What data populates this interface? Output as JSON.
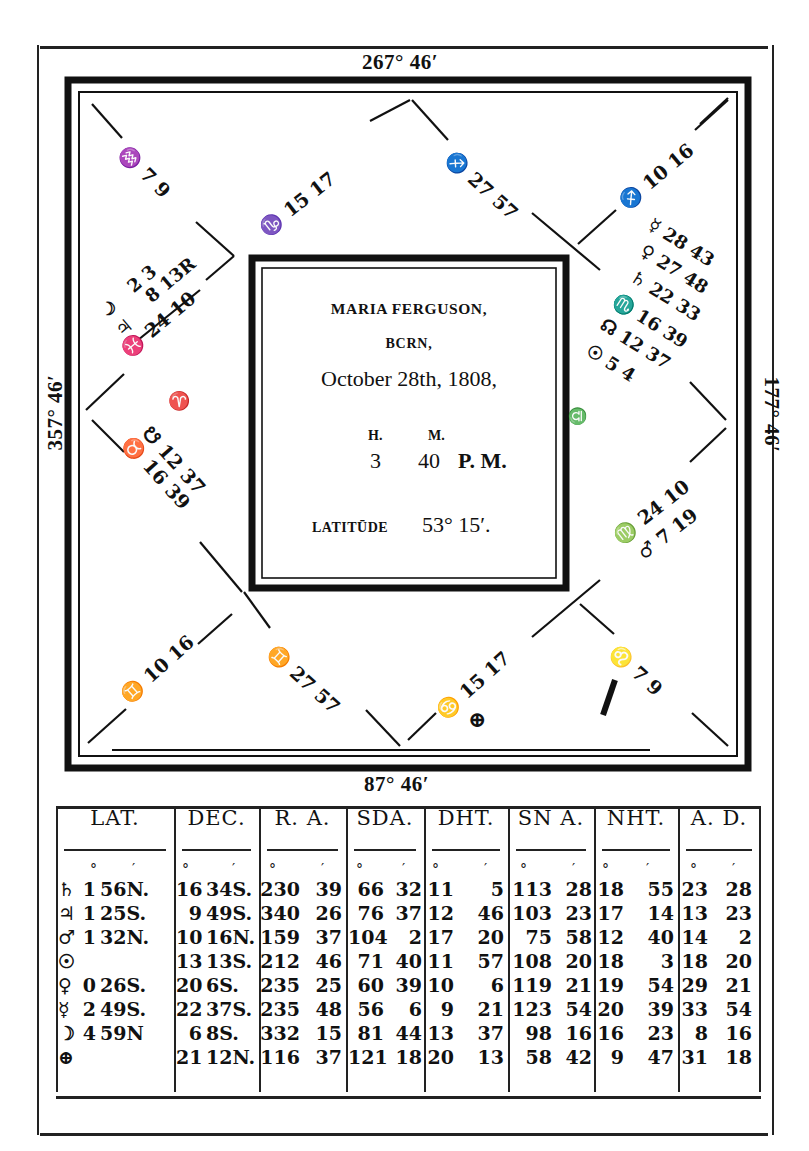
{
  "chart_title": {
    "name": "MARIA FERGUSON,",
    "born": "BCRN,",
    "date": "October 28th, 1808,",
    "time_header_h": "H.",
    "time_header_m": "M.",
    "time_hours": "3",
    "time_minutes": "40",
    "time_suffix": "P. M.",
    "latitude_label": "LATITŪDE",
    "latitude_value": "53° 15′."
  },
  "cusps_outer": {
    "top": "267° 46′",
    "bottom": "87° 46′",
    "left": "357° 46′",
    "right": "177° 46′"
  },
  "houses": {
    "h12_upper_left": {
      "sign": "♒",
      "deg": "7",
      "min": "9"
    },
    "h11_top_left": {
      "sign": "♑",
      "deg": "15",
      "min": "17"
    },
    "h10_top_right": {
      "sign": "♐",
      "deg": "27",
      "min": "57"
    },
    "h9_upper_right": {
      "sign": "♐",
      "deg": "10",
      "min": "16"
    },
    "h1_left_planets": [
      {
        "symbol": "♃",
        "label": "2 3"
      },
      {
        "symbol": "☽",
        "label": "8 13R"
      },
      {
        "symbol": "♃",
        "label": "24 10"
      }
    ],
    "h1_left_cusp": {
      "sign": "♓",
      "deg": "24",
      "min": "10"
    },
    "h1_aries": "♈",
    "h2_left_lower": {
      "sign": "♉",
      "node": "☋",
      "deg1": "12",
      "min1": "37",
      "deg2": "16",
      "min2": "39"
    },
    "h8_right_planets": [
      {
        "symbol": "☿",
        "deg": "28",
        "min": "43"
      },
      {
        "symbol": "♀",
        "deg": "27",
        "min": "48"
      },
      {
        "symbol": "♄",
        "deg": "22",
        "min": "33"
      },
      {
        "symbol": "♏",
        "deg": "16",
        "min": "39"
      },
      {
        "symbol": "☊",
        "deg": "12",
        "min": "37"
      },
      {
        "symbol": "☉",
        "deg": "5",
        "min": "4"
      }
    ],
    "h7_libra": "♎",
    "h6_right_lower": {
      "sign": "♍",
      "deg": "24",
      "min": "10",
      "planet": "♂",
      "pdeg": "7",
      "pmin": "19"
    },
    "h3_lower_left": {
      "sign": "♊",
      "deg": "10",
      "min": "16"
    },
    "h4_bottom_left": {
      "sign": "♊",
      "deg": "27",
      "min": "57"
    },
    "h5_bottom_right": {
      "sign": "♋",
      "deg": "15",
      "min": "17"
    },
    "h6_lower_right": {
      "sign": "♌",
      "deg": "7",
      "min": "9"
    },
    "part_of_fortune": "⊕"
  },
  "table": {
    "columns": [
      {
        "header": "LAT.",
        "units": [
          "°",
          "′"
        ]
      },
      {
        "header": "DEC.",
        "units": [
          "°",
          "′"
        ]
      },
      {
        "header": "R. A.",
        "units": [
          "°",
          "′"
        ]
      },
      {
        "header": "SDA.",
        "units": [
          "°",
          "′"
        ]
      },
      {
        "header": "DHT.",
        "units": [
          "°",
          "′"
        ]
      },
      {
        "header": "SN A.",
        "units": [
          "°",
          "′"
        ]
      },
      {
        "header": "NHT.",
        "units": [
          "°",
          "′"
        ]
      },
      {
        "header": "A. D.",
        "units": [
          "°",
          "′"
        ]
      }
    ],
    "rows": [
      {
        "planet": "♄",
        "lat": [
          "1",
          "56N."
        ],
        "dec": [
          "16",
          "34S."
        ],
        "ra": [
          "230",
          "39"
        ],
        "sda": [
          "66",
          "32"
        ],
        "dht": [
          "11",
          "5"
        ],
        "sna": [
          "113",
          "28"
        ],
        "nht": [
          "18",
          "55"
        ],
        "ad": [
          "23",
          "28"
        ]
      },
      {
        "planet": "♃",
        "lat": [
          "1",
          "25S."
        ],
        "dec": [
          "9",
          "49S."
        ],
        "ra": [
          "340",
          "26"
        ],
        "sda": [
          "76",
          "37"
        ],
        "dht": [
          "12",
          "46"
        ],
        "sna": [
          "103",
          "23"
        ],
        "nht": [
          "17",
          "14"
        ],
        "ad": [
          "13",
          "23"
        ]
      },
      {
        "planet": "♂",
        "lat": [
          "1",
          "32N."
        ],
        "dec": [
          "10",
          "16N."
        ],
        "ra": [
          "159",
          "37"
        ],
        "sda": [
          "104",
          "2"
        ],
        "dht": [
          "17",
          "20"
        ],
        "sna": [
          "75",
          "58"
        ],
        "nht": [
          "12",
          "40"
        ],
        "ad": [
          "14",
          "2"
        ]
      },
      {
        "planet": "☉",
        "lat": [
          "",
          ""
        ],
        "dec": [
          "13",
          "13S."
        ],
        "ra": [
          "212",
          "46"
        ],
        "sda": [
          "71",
          "40"
        ],
        "dht": [
          "11",
          "57"
        ],
        "sna": [
          "108",
          "20"
        ],
        "nht": [
          "18",
          "3"
        ],
        "ad": [
          "18",
          "20"
        ]
      },
      {
        "planet": "♀",
        "lat": [
          "0",
          "26S."
        ],
        "dec": [
          "20",
          "6S."
        ],
        "ra": [
          "235",
          "25"
        ],
        "sda": [
          "60",
          "39"
        ],
        "dht": [
          "10",
          "6"
        ],
        "sna": [
          "119",
          "21"
        ],
        "nht": [
          "19",
          "54"
        ],
        "ad": [
          "29",
          "21"
        ]
      },
      {
        "planet": "☿",
        "lat": [
          "2",
          "49S."
        ],
        "dec": [
          "22",
          "37S."
        ],
        "ra": [
          "235",
          "48"
        ],
        "sda": [
          "56",
          "6"
        ],
        "dht": [
          "9",
          "21"
        ],
        "sna": [
          "123",
          "54"
        ],
        "nht": [
          "20",
          "39"
        ],
        "ad": [
          "33",
          "54"
        ]
      },
      {
        "planet": "☽",
        "lat": [
          "4",
          "59N"
        ],
        "dec": [
          "6",
          "8S."
        ],
        "ra": [
          "332",
          "15"
        ],
        "sda": [
          "81",
          "44"
        ],
        "dht": [
          "13",
          "37"
        ],
        "sna": [
          "98",
          "16"
        ],
        "nht": [
          "16",
          "23"
        ],
        "ad": [
          "8",
          "16"
        ]
      },
      {
        "planet": "⊕",
        "lat": [
          "",
          ""
        ],
        "dec": [
          "21",
          "12N."
        ],
        "ra": [
          "116",
          "37"
        ],
        "sda": [
          "121",
          "18"
        ],
        "dht": [
          "20",
          "13"
        ],
        "sna": [
          "58",
          "42"
        ],
        "nht": [
          "9",
          "47"
        ],
        "ad": [
          "31",
          "18"
        ]
      }
    ]
  }
}
